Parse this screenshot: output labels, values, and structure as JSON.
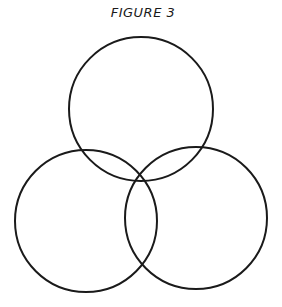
{
  "figure": {
    "title": "FIGURE 3",
    "stroke_color": "#1a1a1a",
    "stroke_width": 2,
    "circles": [
      {
        "name": "top",
        "cx": 141,
        "cy": 109,
        "r": 72
      },
      {
        "name": "bottom-left",
        "cx": 86,
        "cy": 221,
        "r": 71
      },
      {
        "name": "bottom-right",
        "cx": 196,
        "cy": 218,
        "r": 71
      }
    ]
  }
}
